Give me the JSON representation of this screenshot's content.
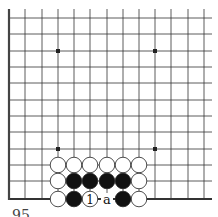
{
  "board": {
    "description": "Go board corner diagram (bottom-left edge)",
    "line_color": "#333333",
    "edge_color": "#444444",
    "columns_x": [
      9,
      25,
      42,
      58,
      74,
      90,
      107,
      123,
      139,
      155,
      171,
      188,
      204
    ],
    "rows_y": [
      18,
      34,
      51,
      67,
      83,
      100,
      116,
      132,
      149,
      165,
      181,
      199
    ],
    "star_points": [
      [
        58,
        51
      ],
      [
        155,
        51
      ],
      [
        58,
        149
      ],
      [
        155,
        149
      ]
    ],
    "stones": [
      {
        "color": "white",
        "x": 58,
        "y": 165
      },
      {
        "color": "white",
        "x": 74,
        "y": 165
      },
      {
        "color": "white",
        "x": 90,
        "y": 165
      },
      {
        "color": "white",
        "x": 107,
        "y": 165
      },
      {
        "color": "white",
        "x": 123,
        "y": 165
      },
      {
        "color": "white",
        "x": 139,
        "y": 165
      },
      {
        "color": "white",
        "x": 58,
        "y": 181
      },
      {
        "color": "black",
        "x": 74,
        "y": 181
      },
      {
        "color": "black",
        "x": 90,
        "y": 181
      },
      {
        "color": "black",
        "x": 107,
        "y": 181
      },
      {
        "color": "black",
        "x": 123,
        "y": 181
      },
      {
        "color": "white",
        "x": 139,
        "y": 181
      },
      {
        "color": "white",
        "x": 58,
        "y": 199
      },
      {
        "color": "black",
        "x": 74,
        "y": 199
      },
      {
        "color": "white",
        "x": 90,
        "y": 199,
        "label": "1"
      },
      {
        "color": "black",
        "x": 123,
        "y": 199
      },
      {
        "color": "white",
        "x": 139,
        "y": 199
      }
    ],
    "markers": [
      {
        "label": "a",
        "x": 107,
        "y": 199
      }
    ]
  },
  "caption": "95"
}
